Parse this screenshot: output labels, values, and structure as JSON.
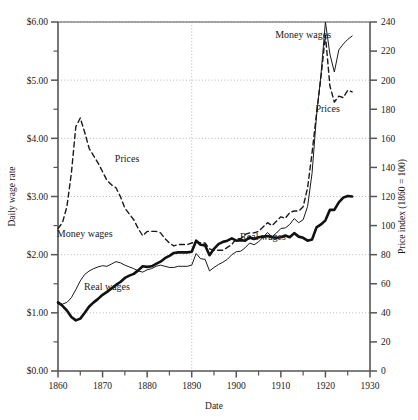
{
  "chart_data": {
    "type": "line",
    "title": "",
    "xlabel": "Date",
    "ylabel": "Daily wage rate",
    "y2label": "Price index (1860 = 100)",
    "xlim": [
      1860,
      1930
    ],
    "ylim": [
      0,
      6
    ],
    "y2lim": [
      0,
      240
    ],
    "grid": true,
    "grid_y_values": [
      1.0,
      2.0,
      3.0,
      4.0,
      5.0,
      6.0
    ],
    "grid_x_values": [
      1890
    ],
    "legend_position": "inline-annotations",
    "xticks": [
      1860,
      1870,
      1880,
      1890,
      1900,
      1910,
      1920,
      1930
    ],
    "xtick_labels": [
      "1860",
      "1870",
      "1880",
      "1890",
      "1900",
      "1910",
      "1920",
      "1930"
    ],
    "xminor_ticks": [
      1865,
      1875,
      1885,
      1895,
      1905,
      1915,
      1925
    ],
    "yticks": [
      0.0,
      0.5,
      1.0,
      1.5,
      2.0,
      2.5,
      3.0,
      3.5,
      4.0,
      4.5,
      5.0,
      5.5,
      6.0
    ],
    "ytick_labels": [
      "$0.00",
      "",
      "$1.00",
      "",
      "$2.00",
      "",
      "$3.00",
      "",
      "$4.00",
      "",
      "$5.00",
      "",
      "$6.00"
    ],
    "y2ticks": [
      0,
      20,
      40,
      60,
      80,
      100,
      120,
      140,
      160,
      180,
      200,
      220,
      240
    ],
    "y2tick_labels": [
      "0",
      "20",
      "40",
      "60",
      "80",
      "100",
      "120",
      "140",
      "160",
      "180",
      "200",
      "220",
      "240"
    ],
    "annotations": [
      {
        "text": "Money wages",
        "x": 1915.0,
        "y": 5.72,
        "name": "money-wages-label-upper"
      },
      {
        "text": "Prices",
        "x": 1920.5,
        "y": 4.45,
        "name": "prices-label-right"
      },
      {
        "text": "Prices",
        "x": 1875.5,
        "y": 3.6,
        "name": "prices-label-left"
      },
      {
        "text": "Money wages",
        "x": 1866.0,
        "y": 2.3,
        "name": "money-wages-label-lower"
      },
      {
        "text": "Real wages",
        "x": 1871.0,
        "y": 1.39,
        "name": "real-wages-label-left"
      },
      {
        "text": "Real wages",
        "x": 1906.0,
        "y": 2.26,
        "name": "real-wages-label-right"
      }
    ],
    "series": [
      {
        "name": "Prices",
        "axis": "right",
        "style": "dashed",
        "color": "#1a1a1a",
        "width": 1.4,
        "x": [
          1860,
          1861,
          1862,
          1863,
          1864,
          1865,
          1866,
          1867,
          1868,
          1869,
          1870,
          1871,
          1872,
          1873,
          1874,
          1875,
          1876,
          1877,
          1878,
          1879,
          1880,
          1881,
          1882,
          1883,
          1884,
          1885,
          1886,
          1887,
          1888,
          1889,
          1890,
          1891,
          1892,
          1893,
          1894,
          1895,
          1896,
          1897,
          1898,
          1899,
          1900,
          1901,
          1902,
          1903,
          1904,
          1905,
          1906,
          1907,
          1908,
          1909,
          1910,
          1911,
          1912,
          1913,
          1914,
          1915,
          1916,
          1917,
          1918,
          1919,
          1920,
          1921,
          1922,
          1923,
          1924,
          1925,
          1926
        ],
        "values": [
          98,
          102,
          113,
          136,
          168,
          174,
          164,
          153,
          148,
          143,
          137,
          131,
          128,
          126,
          120,
          112,
          108,
          104,
          98,
          93,
          96,
          96,
          96,
          95,
          91,
          88,
          86,
          87,
          87,
          87,
          88,
          89,
          88,
          88,
          84,
          83,
          83,
          83,
          85,
          87,
          91,
          91,
          94,
          95,
          95,
          96,
          99,
          102,
          100,
          103,
          106,
          105,
          109,
          110,
          110,
          113,
          126,
          150,
          177,
          202,
          231,
          196,
          185,
          189,
          188,
          193,
          192
        ]
      },
      {
        "name": "Money wages",
        "axis": "left",
        "style": "solid-thin",
        "color": "#1a1a1a",
        "width": 1.0,
        "x": [
          1860,
          1861,
          1862,
          1863,
          1864,
          1865,
          1866,
          1867,
          1868,
          1869,
          1870,
          1871,
          1872,
          1873,
          1874,
          1875,
          1876,
          1877,
          1878,
          1879,
          1880,
          1881,
          1882,
          1883,
          1884,
          1885,
          1886,
          1887,
          1888,
          1889,
          1890,
          1891,
          1892,
          1893,
          1894,
          1895,
          1896,
          1897,
          1898,
          1899,
          1900,
          1901,
          1902,
          1903,
          1904,
          1905,
          1906,
          1907,
          1908,
          1909,
          1910,
          1911,
          1912,
          1913,
          1914,
          1915,
          1916,
          1917,
          1918,
          1919,
          1920,
          1921,
          1922,
          1923,
          1924,
          1925,
          1926
        ],
        "values": [
          1.16,
          1.15,
          1.18,
          1.26,
          1.4,
          1.55,
          1.66,
          1.72,
          1.76,
          1.79,
          1.81,
          1.8,
          1.84,
          1.88,
          1.86,
          1.82,
          1.79,
          1.76,
          1.72,
          1.7,
          1.74,
          1.76,
          1.8,
          1.82,
          1.8,
          1.78,
          1.78,
          1.8,
          1.8,
          1.8,
          1.82,
          2.02,
          1.93,
          1.92,
          1.72,
          1.78,
          1.83,
          1.87,
          1.92,
          2.0,
          2.05,
          2.06,
          2.12,
          2.2,
          2.17,
          2.22,
          2.3,
          2.38,
          2.31,
          2.37,
          2.45,
          2.46,
          2.52,
          2.62,
          2.55,
          2.6,
          2.83,
          3.4,
          4.38,
          5.1,
          6.0,
          5.45,
          5.14,
          5.52,
          5.62,
          5.7,
          5.76
        ]
      },
      {
        "name": "Real wages",
        "axis": "left",
        "style": "solid-thick",
        "color": "#111111",
        "width": 2.6,
        "x": [
          1860,
          1861,
          1862,
          1863,
          1864,
          1865,
          1866,
          1867,
          1868,
          1869,
          1870,
          1871,
          1872,
          1873,
          1874,
          1875,
          1876,
          1877,
          1878,
          1879,
          1880,
          1881,
          1882,
          1883,
          1884,
          1885,
          1886,
          1887,
          1888,
          1889,
          1890,
          1891,
          1892,
          1893,
          1894,
          1895,
          1896,
          1897,
          1898,
          1899,
          1900,
          1901,
          1902,
          1903,
          1904,
          1905,
          1906,
          1907,
          1908,
          1909,
          1910,
          1911,
          1912,
          1913,
          1914,
          1915,
          1916,
          1917,
          1918,
          1919,
          1920,
          1921,
          1922,
          1923,
          1924,
          1925,
          1926
        ],
        "values": [
          1.18,
          1.12,
          1.04,
          0.93,
          0.87,
          0.9,
          1.0,
          1.11,
          1.18,
          1.24,
          1.31,
          1.36,
          1.42,
          1.48,
          1.53,
          1.6,
          1.64,
          1.67,
          1.73,
          1.8,
          1.79,
          1.8,
          1.84,
          1.88,
          1.94,
          1.98,
          2.03,
          2.04,
          2.04,
          2.04,
          2.05,
          2.24,
          2.17,
          2.16,
          1.99,
          2.1,
          2.18,
          2.22,
          2.24,
          2.28,
          2.24,
          2.25,
          2.24,
          2.3,
          2.27,
          2.3,
          2.31,
          2.32,
          2.3,
          2.29,
          2.3,
          2.33,
          2.3,
          2.37,
          2.31,
          2.29,
          2.24,
          2.26,
          2.47,
          2.52,
          2.59,
          2.77,
          2.77,
          2.9,
          2.98,
          3.01,
          3.0
        ]
      }
    ]
  },
  "axes": {
    "y_label": "Daily wage rate",
    "y2_label": "Price index (1860 = 100)",
    "x_label": "Date"
  }
}
